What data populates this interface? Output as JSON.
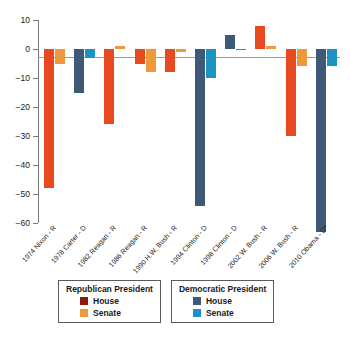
{
  "chart_data": {
    "type": "bar",
    "title": "",
    "subtitle": "",
    "xlabel": "",
    "ylabel": "",
    "ylim": [
      -60,
      10
    ],
    "yticks": [
      10,
      0,
      -10,
      -20,
      -30,
      -40,
      -50,
      -60
    ],
    "ytick_labels": [
      "10",
      "0",
      "−10",
      "−20",
      "−30",
      "−40",
      "−50",
      "−60"
    ],
    "grid": false,
    "legend_position": "bottom",
    "categories": [
      "1974 Nixon - R",
      "1978 Carter - D",
      "1982 Reagan - R",
      "1986 Reagan - R",
      "1990 H.W. Bush - R",
      "1994 Clinton - D",
      "1998 Clinton - D",
      "2002 W. Bush - R",
      "2006 W. Bush - R",
      "2010 Obama - D*"
    ],
    "category_party": [
      "R",
      "D",
      "R",
      "R",
      "R",
      "D",
      "D",
      "R",
      "R",
      "D"
    ],
    "series": [
      {
        "name": "House",
        "values": [
          -48,
          -15,
          -26,
          -5,
          -8,
          -54,
          5,
          8,
          -30,
          -63
        ]
      },
      {
        "name": "Senate",
        "values": [
          -5,
          -3,
          1,
          -8,
          -1,
          -10,
          0,
          1,
          -6,
          -6
        ]
      }
    ],
    "colors": {
      "republican_house": "#E8491E",
      "republican_senate": "#EE9A3A",
      "democratic_house": "#3F5A78",
      "democratic_senate": "#1C93C4",
      "legend_republican_house_swatch": "#8E1A0C",
      "legend_republican_senate_swatch": "#EE9A3A",
      "legend_democratic_house_swatch": "#3F5A78",
      "legend_democratic_senate_swatch": "#1C93C4",
      "axis": "#7b7b7b",
      "background": "#FFFFFF"
    }
  },
  "legend": {
    "republican": {
      "title": "Republican President",
      "items": [
        {
          "label": "House",
          "color": "#8E1A0C"
        },
        {
          "label": "Senate",
          "color": "#EE9A3A"
        }
      ]
    },
    "democratic": {
      "title": "Democratic President",
      "items": [
        {
          "label": "House",
          "color": "#3F5A78"
        },
        {
          "label": "Senate",
          "color": "#1C93C4"
        }
      ]
    }
  }
}
